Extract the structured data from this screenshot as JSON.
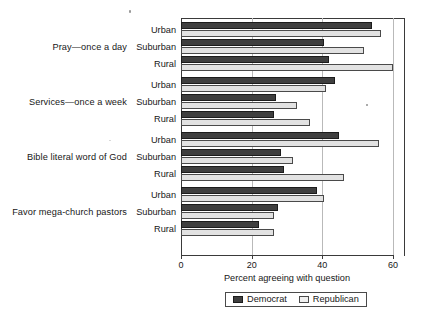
{
  "chart_data": {
    "type": "bar",
    "orientation": "horizontal",
    "title": "",
    "xlabel": "Percent agreeing with question",
    "ylabel": "",
    "xlim": [
      0,
      60
    ],
    "xticks": [
      0,
      20,
      40,
      60
    ],
    "xtick_labels": [
      "0",
      "20",
      "40",
      "60"
    ],
    "grid": "vertical",
    "legend_position": "bottom-center",
    "legend": [
      "Democrat",
      "Republican"
    ],
    "colors": {
      "democrat": "#3f3f3f",
      "republican": "#e2e2e2",
      "axis": "#3a3a3a",
      "gridline": "#b9b9b9",
      "text": "#171717"
    },
    "groups": [
      {
        "label": "Pray—once a day",
        "subgroups": [
          {
            "label": "Urban",
            "democrat": 54.0,
            "republican": 56.5
          },
          {
            "label": "Suburban",
            "democrat": 40.5,
            "republican": 51.7
          },
          {
            "label": "Rural",
            "democrat": 42.0,
            "republican": 60.0
          }
        ]
      },
      {
        "label": "Services—once a week",
        "subgroups": [
          {
            "label": "Urban",
            "democrat": 43.6,
            "republican": 41.1
          },
          {
            "label": "Suburban",
            "democrat": 27.0,
            "republican": 32.7
          },
          {
            "label": "Rural",
            "democrat": 26.2,
            "republican": 36.5
          }
        ]
      },
      {
        "label": "Bible literal word of God",
        "subgroups": [
          {
            "label": "Urban",
            "democrat": 44.7,
            "republican": 56.0
          },
          {
            "label": "Suburban",
            "democrat": 28.3,
            "republican": 31.8
          },
          {
            "label": "Rural",
            "democrat": 29.2,
            "republican": 46.0
          }
        ]
      },
      {
        "label": "Favor mega-church pastors",
        "subgroups": [
          {
            "label": "Urban",
            "democrat": 38.6,
            "republican": 40.4
          },
          {
            "label": "Suburban",
            "democrat": 27.5,
            "republican": 26.4
          },
          {
            "label": "Rural",
            "democrat": 22.0,
            "republican": 26.4
          }
        ]
      }
    ],
    "series": [
      {
        "name": "Democrat",
        "values": [
          54.0,
          40.5,
          42.0,
          43.6,
          27.0,
          26.2,
          44.7,
          28.3,
          29.2,
          38.6,
          27.5,
          22.0
        ]
      },
      {
        "name": "Republican",
        "values": [
          56.5,
          51.7,
          60.0,
          41.1,
          32.7,
          36.5,
          56.0,
          31.8,
          46.0,
          40.4,
          26.4,
          26.4
        ]
      }
    ],
    "categories": [
      "Pray—once a day / Urban",
      "Pray—once a day / Suburban",
      "Pray—once a day / Rural",
      "Services—once a week / Urban",
      "Services—once a week / Suburban",
      "Services—once a week / Rural",
      "Bible literal word of God / Urban",
      "Bible literal word of God / Suburban",
      "Bible literal word of God / Rural",
      "Favor mega-church pastors / Urban",
      "Favor mega-church pastors / Suburban",
      "Favor mega-church pastors / Rural"
    ]
  }
}
